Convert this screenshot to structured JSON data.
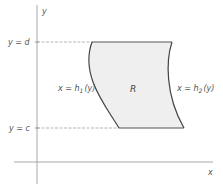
{
  "diagram": {
    "axes": {
      "x_label": "x",
      "y_label": "y"
    },
    "guides": {
      "top_label": "y = d",
      "bottom_label": "y = c"
    },
    "region": {
      "label": "R",
      "left_boundary_label": "x = h",
      "left_boundary_sub": "1",
      "left_boundary_arg": "(y)",
      "right_boundary_label": "x = h",
      "right_boundary_sub": "2",
      "right_boundary_arg": "(y)"
    },
    "colors": {
      "region_fill": "#efefef",
      "boundary_stroke": "#444444",
      "axis_stroke": "#aaaaaa",
      "guide_stroke": "#b0b0b0",
      "text": "#555555"
    }
  }
}
